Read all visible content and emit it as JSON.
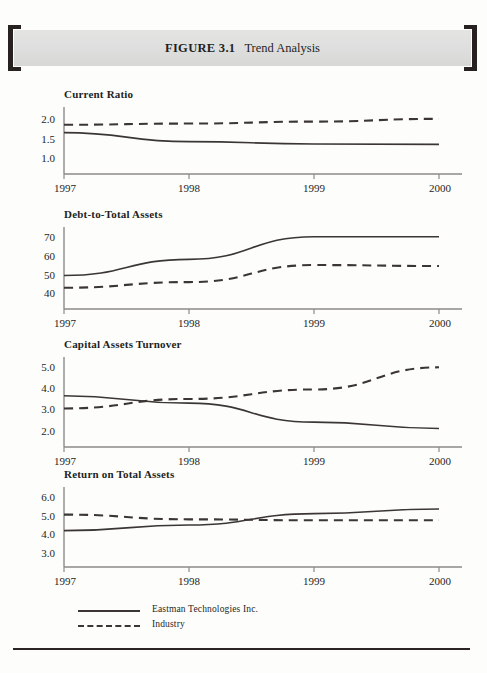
{
  "figure": {
    "label": "FIGURE 3.1",
    "caption": "Trend Analysis",
    "bracket_left_icon": "bracket-left-icon",
    "bracket_right_icon": "bracket-right-icon"
  },
  "legend": {
    "entries": [
      {
        "label": "Eastman Technologies Inc.",
        "style": "solid"
      },
      {
        "label": "Industry",
        "style": "dashed"
      }
    ]
  },
  "colors": {
    "ink": "#231f1e",
    "line": "#3b3634",
    "axis": "#8d8a88",
    "band": "#dedede",
    "bracket": "#272220",
    "page": "#fdfdfb"
  },
  "chart_data": [
    {
      "type": "line",
      "title": "Current Ratio",
      "xlabel": "",
      "ylabel": "",
      "x": [
        "1997",
        "1998",
        "1999",
        "2000"
      ],
      "categories": [
        "1997",
        "1998",
        "1999",
        "2000"
      ],
      "yticks": [
        "1.0",
        "1.5",
        "2.0"
      ],
      "ytick_values": [
        1.0,
        1.5,
        2.0
      ],
      "ylim": [
        0.8,
        2.2
      ],
      "grid": false,
      "legend": "bottom-shared",
      "series": [
        {
          "name": "Eastman Technologies Inc.",
          "style": "solid",
          "values": [
            1.65,
            1.42,
            1.36,
            1.35
          ]
        },
        {
          "name": "Industry",
          "style": "dashed",
          "values": [
            1.85,
            1.88,
            1.93,
            2.0
          ]
        }
      ]
    },
    {
      "type": "line",
      "title": "Debt-to-Total Assets",
      "xlabel": "",
      "ylabel": "",
      "x": [
        "1997",
        "1998",
        "1999",
        "2000"
      ],
      "categories": [
        "1997",
        "1998",
        "1999",
        "2000"
      ],
      "yticks": [
        "40",
        "50",
        "60",
        "70"
      ],
      "ytick_values": [
        40,
        50,
        60,
        70
      ],
      "ylim": [
        36,
        73
      ],
      "grid": false,
      "legend": "bottom-shared",
      "series": [
        {
          "name": "Eastman Technologies Inc.",
          "style": "solid",
          "values": [
            49.5,
            58.0,
            70.0,
            70.0
          ]
        },
        {
          "name": "Industry",
          "style": "dashed",
          "values": [
            43.0,
            46.0,
            55.0,
            54.5
          ]
        }
      ]
    },
    {
      "type": "line",
      "title": "Capital Assets Turnover",
      "xlabel": "",
      "ylabel": "",
      "x": [
        "1997",
        "1998",
        "1999",
        "2000"
      ],
      "categories": [
        "1997",
        "1998",
        "1999",
        "2000"
      ],
      "yticks": [
        "2.0",
        "3.0",
        "4.0",
        "5.0"
      ],
      "ytick_values": [
        2.0,
        3.0,
        4.0,
        5.0
      ],
      "ylim": [
        1.6,
        5.3
      ],
      "grid": false,
      "legend": "bottom-shared",
      "series": [
        {
          "name": "Eastman Technologies Inc.",
          "style": "solid",
          "values": [
            3.65,
            3.3,
            2.4,
            2.1
          ]
        },
        {
          "name": "Industry",
          "style": "dashed",
          "values": [
            3.05,
            3.5,
            3.95,
            5.0
          ]
        }
      ]
    },
    {
      "type": "line",
      "title": "Return on Total Assets",
      "xlabel": "",
      "ylabel": "",
      "x": [
        "1997",
        "1998",
        "1999",
        "2000"
      ],
      "categories": [
        "1997",
        "1998",
        "1999",
        "2000"
      ],
      "yticks": [
        "3.0",
        "4.0",
        "5.0",
        "6.0"
      ],
      "ytick_values": [
        3.0,
        4.0,
        5.0,
        6.0
      ],
      "ylim": [
        2.7,
        6.3
      ],
      "grid": false,
      "legend": "bottom-shared",
      "series": [
        {
          "name": "Eastman Technologies Inc.",
          "style": "solid",
          "values": [
            4.2,
            4.5,
            5.1,
            5.35
          ]
        },
        {
          "name": "Industry",
          "style": "dashed",
          "values": [
            5.05,
            4.8,
            4.75,
            4.75
          ]
        }
      ]
    }
  ]
}
